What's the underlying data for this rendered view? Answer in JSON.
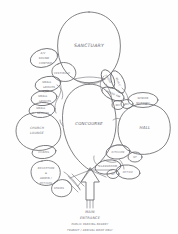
{
  "document": {
    "type": "hand-drawn-bubble-diagram",
    "subject": "church-building-program-adjacency-diagram",
    "ink_color": "#6b6b70",
    "paper_color": "#fefefe"
  },
  "spaces": {
    "primary": [
      {
        "id": "sanctuary",
        "label": "SANCTUARY"
      },
      {
        "id": "concourse",
        "label": "CONCOURSE"
      },
      {
        "id": "hall",
        "label": "HALL"
      },
      {
        "id": "church-lounge",
        "label": "CHURCH LOUNGE"
      }
    ],
    "left_cluster": [
      {
        "id": "av-sound-control",
        "label_lines": [
          "A/V",
          "SOUND",
          "CONTROL"
        ]
      },
      {
        "id": "vestibule",
        "label_lines": [
          "VESTIBULE"
        ]
      },
      {
        "id": "small-groups-a",
        "label_lines": [
          "SMALL",
          "GROUPS"
        ]
      },
      {
        "id": "small-groups-b",
        "label_lines": [
          "SMALL",
          "GROUPS"
        ]
      },
      {
        "id": "small-groups-c",
        "label_lines": [
          "SMALL",
          "GROUPS"
        ]
      }
    ],
    "lower_left_cluster": [
      {
        "id": "chapel",
        "label_lines": [
          "CHAPEL"
        ]
      },
      {
        "id": "reception-admin",
        "label_lines": [
          "RECEPTION",
          "&",
          "ADMIN /",
          "OFFICES"
        ]
      },
      {
        "id": "stairs",
        "label_lines": [
          "STAIRS"
        ]
      }
    ],
    "upper_right_cluster": [
      {
        "id": "choir",
        "label_lines": [
          "CHOIR"
        ]
      },
      {
        "id": "music",
        "label_lines": [
          "MUSIC"
        ]
      },
      {
        "id": "green-room",
        "label_lines": [
          "GREEN RM"
        ]
      },
      {
        "id": "wc-a",
        "label_lines": [
          "WC"
        ]
      },
      {
        "id": "wc-b",
        "label_lines": [
          "WC"
        ]
      },
      {
        "id": "senior-nursery",
        "label_lines": [
          "SENIOR",
          "NURSERY"
        ]
      }
    ],
    "lower_right_cluster": [
      {
        "id": "kitchen",
        "label_lines": [
          "KITCHEN"
        ]
      },
      {
        "id": "storage-a",
        "label_lines": [
          "ST"
        ]
      },
      {
        "id": "classroom",
        "label_lines": [
          "CLASSROOM"
        ]
      },
      {
        "id": "storage-b",
        "label_lines": [
          "ST"
        ]
      },
      {
        "id": "office",
        "label_lines": [
          "OFFICE"
        ]
      }
    ]
  },
  "entrance": {
    "title_lines": [
      "MAIN",
      "ENTRANCE"
    ],
    "note_line_1": "PUBLIC PARKING NEARBY",
    "note_line_2": "TRANSIT / ARRIVAL DROP ONLY",
    "arrow": "up-arrow"
  }
}
